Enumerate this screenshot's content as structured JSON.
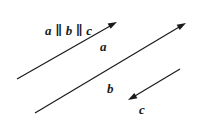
{
  "diagram": {
    "relation_label": "a ∥ b ∥ c",
    "background": "#ffffff",
    "stroke_color": "#1a1a1a",
    "vectors": [
      {
        "name": "a",
        "label": "a",
        "start": [
          17,
          79
        ],
        "end": [
          117,
          22
        ],
        "direction": "up-right"
      },
      {
        "name": "b",
        "label": "b",
        "start": [
          35,
          113
        ],
        "end": [
          186,
          23
        ],
        "direction": "up-right"
      },
      {
        "name": "c",
        "label": "c",
        "start": [
          180,
          69
        ],
        "end": [
          128,
          100
        ],
        "direction": "down-left"
      }
    ]
  }
}
